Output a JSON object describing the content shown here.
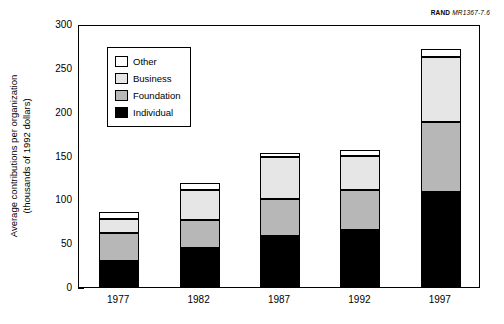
{
  "figure": {
    "source_credit": {
      "brand": "RAND",
      "document_id": "MR1367-7.6"
    }
  },
  "chart_data": {
    "type": "bar",
    "stacked": true,
    "title": "",
    "subtitle": "",
    "xlabel": "",
    "ylabel": "Average contributions per organization\n(thousands of 1992 dollars)",
    "categories": [
      "1977",
      "1982",
      "1987",
      "1992",
      "1997"
    ],
    "ylim": [
      0,
      300
    ],
    "yticks": [
      0,
      50,
      100,
      150,
      200,
      250,
      300
    ],
    "ytick_labels": [
      "0",
      "50",
      "100",
      "150",
      "200",
      "250",
      "300"
    ],
    "grid": false,
    "legend_position": "upper-left-inside",
    "series": [
      {
        "name": "Individual",
        "color": "#000000",
        "values": [
          30,
          44,
          58,
          65,
          108
        ]
      },
      {
        "name": "Foundation",
        "color": "#b7b7b7",
        "values": [
          32,
          33,
          42,
          46,
          80
        ]
      },
      {
        "name": "Business",
        "color": "#e6e6e6",
        "values": [
          16,
          34,
          48,
          38,
          74
        ]
      },
      {
        "name": "Other",
        "color": "#ffffff",
        "values": [
          8,
          8,
          5,
          7,
          10
        ]
      }
    ],
    "totals": [
      86,
      119,
      153,
      156,
      272
    ]
  }
}
